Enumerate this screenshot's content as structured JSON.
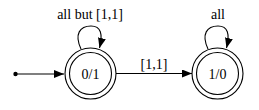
{
  "diagram": {
    "type": "finite-state-automaton",
    "initial_state": "0/1",
    "states": [
      {
        "id": "q0",
        "label": "0/1",
        "accepting": true,
        "cx": 90.5,
        "cy": 73.5
      },
      {
        "id": "q1",
        "label": "1/0",
        "accepting": true,
        "cx": 217.5,
        "cy": 73.5
      }
    ],
    "transitions": [
      {
        "from": "0/1",
        "to": "0/1",
        "label": "all but [1,1]"
      },
      {
        "from": "0/1",
        "to": "1/0",
        "label": "[1,1]"
      },
      {
        "from": "1/0",
        "to": "1/0",
        "label": "all"
      }
    ],
    "colors": {
      "stroke": "#000000",
      "background": "#ffffff"
    }
  }
}
